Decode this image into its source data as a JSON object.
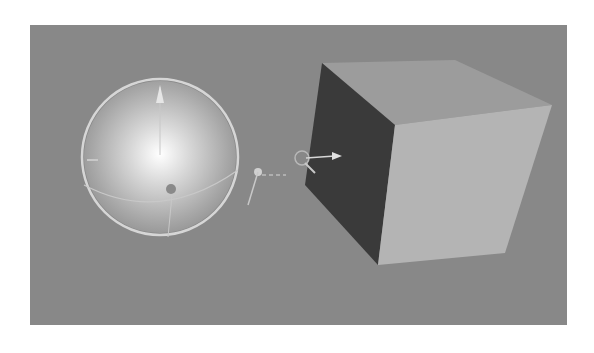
{
  "viewport": {
    "background_color": "#888888",
    "objects": [
      {
        "name": "sphere",
        "type": "sphere",
        "selected": true,
        "gizmo": "rotate"
      },
      {
        "name": "light-handle",
        "type": "empty"
      },
      {
        "name": "cube",
        "type": "cube",
        "gizmo": "translate"
      }
    ]
  },
  "colors": {
    "cube_top": "#9c9c9c",
    "cube_front": "#b4b4b4",
    "cube_side": "#3a3a3a",
    "gizmo": "#d6d6d6"
  }
}
